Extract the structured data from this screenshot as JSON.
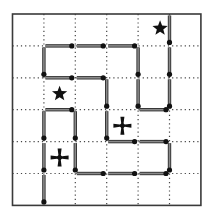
{
  "puzzle": {
    "grid": {
      "cols": 6,
      "rows": 6,
      "origin_x": 12.5,
      "origin_y": 14,
      "cell_w": 31.4,
      "cell_h": 31.9
    },
    "colors": {
      "border": "#3a3a3a",
      "grid": "#444444",
      "match": "#8a8a8a",
      "match_edge": "#2e2e2e",
      "head": "#111111",
      "symbol": "#111111"
    },
    "matches": [
      {
        "x1": 5,
        "y1": 0,
        "x2": 5,
        "y2": 1
      },
      {
        "x1": 5,
        "y1": 1,
        "x2": 5,
        "y2": 2
      },
      {
        "x1": 1,
        "y1": 1,
        "x2": 2,
        "y2": 1
      },
      {
        "x1": 2,
        "y1": 1,
        "x2": 3,
        "y2": 1
      },
      {
        "x1": 3,
        "y1": 1,
        "x2": 4,
        "y2": 1
      },
      {
        "x1": 1,
        "y1": 1,
        "x2": 1,
        "y2": 2
      },
      {
        "x1": 4,
        "y1": 1,
        "x2": 4,
        "y2": 2
      },
      {
        "x1": 1,
        "y1": 2,
        "x2": 2,
        "y2": 2
      },
      {
        "x1": 2,
        "y1": 2,
        "x2": 3,
        "y2": 2
      },
      {
        "x1": 3,
        "y1": 2,
        "x2": 3,
        "y2": 3
      },
      {
        "x1": 4,
        "y1": 2,
        "x2": 4,
        "y2": 3
      },
      {
        "x1": 5,
        "y1": 2,
        "x2": 5,
        "y2": 3
      },
      {
        "x1": 1,
        "y1": 3,
        "x2": 2,
        "y2": 3
      },
      {
        "x1": 4,
        "y1": 3,
        "x2": 5,
        "y2": 3
      },
      {
        "x1": 1,
        "y1": 3,
        "x2": 1,
        "y2": 4
      },
      {
        "x1": 2,
        "y1": 3,
        "x2": 2,
        "y2": 4
      },
      {
        "x1": 3,
        "y1": 3,
        "x2": 3,
        "y2": 4
      },
      {
        "x1": 3,
        "y1": 4,
        "x2": 4,
        "y2": 4
      },
      {
        "x1": 4,
        "y1": 4,
        "x2": 5,
        "y2": 4
      },
      {
        "x1": 1,
        "y1": 4,
        "x2": 1,
        "y2": 5
      },
      {
        "x1": 2,
        "y1": 4,
        "x2": 2,
        "y2": 5
      },
      {
        "x1": 5,
        "y1": 4,
        "x2": 5,
        "y2": 5
      },
      {
        "x1": 2,
        "y1": 5,
        "x2": 3,
        "y2": 5
      },
      {
        "x1": 3,
        "y1": 5,
        "x2": 4,
        "y2": 5
      },
      {
        "x1": 4,
        "y1": 5,
        "x2": 5,
        "y2": 5
      },
      {
        "x1": 1,
        "y1": 5,
        "x2": 1,
        "y2": 6
      }
    ],
    "symbols": [
      {
        "type": "star",
        "col": 4,
        "row": 0,
        "dx": 0.2,
        "dy": -0.05
      },
      {
        "type": "star",
        "col": 1,
        "row": 2,
        "dx": 0,
        "dy": 0
      },
      {
        "type": "cross",
        "col": 3,
        "row": 3,
        "dx": 0,
        "dy": 0
      },
      {
        "type": "cross",
        "col": 1,
        "row": 4,
        "dx": 0,
        "dy": 0
      }
    ]
  }
}
